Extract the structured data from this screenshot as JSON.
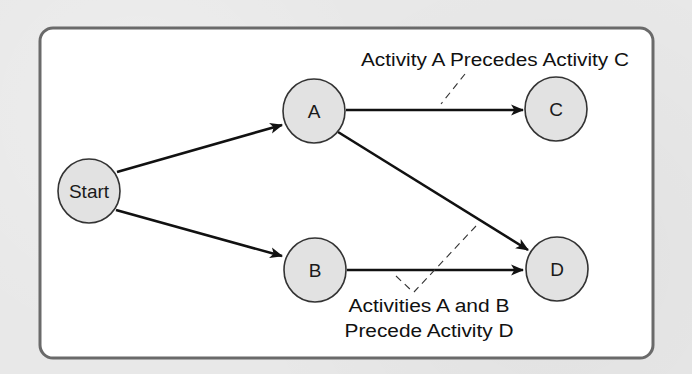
{
  "diagram": {
    "type": "activity-on-node precedence network",
    "nodes": [
      {
        "id": "start",
        "label": "Start",
        "cx": 89,
        "cy": 191,
        "rx": 31,
        "ry": 32
      },
      {
        "id": "a",
        "label": "A",
        "cx": 314,
        "cy": 111,
        "rx": 31,
        "ry": 32
      },
      {
        "id": "b",
        "label": "B",
        "cx": 315,
        "cy": 270,
        "rx": 31,
        "ry": 32
      },
      {
        "id": "c",
        "label": "C",
        "cx": 556,
        "cy": 109,
        "rx": 31,
        "ry": 32
      },
      {
        "id": "d",
        "label": "D",
        "cx": 557,
        "cy": 269,
        "rx": 31,
        "ry": 32
      }
    ],
    "edges": [
      {
        "from": "Start",
        "to": "A"
      },
      {
        "from": "Start",
        "to": "B"
      },
      {
        "from": "A",
        "to": "C"
      },
      {
        "from": "A",
        "to": "D"
      },
      {
        "from": "B",
        "to": "D"
      }
    ],
    "annotations": {
      "a_precedes_c": "Activity A Precedes Activity C",
      "ab_precede_d_line1": "Activities A and B",
      "ab_precede_d_line2": "Precede Activity D"
    },
    "colors": {
      "background": "#e8e8e8",
      "frame_fill": "#ffffff",
      "frame_stroke": "#6a6a6a",
      "node_fill": "#e2e2e2",
      "node_stroke": "#333333",
      "edge": "#111111"
    }
  }
}
